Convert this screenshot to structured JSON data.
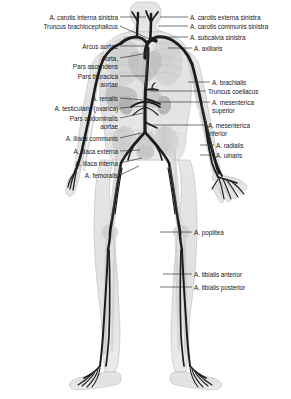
{
  "figure": {
    "type": "anatomical-diagram",
    "view": "anterior whole-body",
    "colors": {
      "artery": "#1c1c1c",
      "artery_highlight": "#6e6e6e",
      "body_silhouette": "#d9d9d9",
      "body_outline": "#9a9a9a",
      "organ": "#a8a8a8",
      "bone": "#c4c4c4",
      "leader_line": "#2b2b2b",
      "label_text": "#1a1a1a",
      "background": "#ffffff"
    }
  },
  "labels_left": [
    {
      "id": "carotis-interna-sinistra",
      "lines": [
        "A. carotis interna sinistra"
      ],
      "x_right": 118,
      "y": 14,
      "leader": {
        "x1": 120,
        "y1": 17,
        "x2": 146,
        "y2": 17
      }
    },
    {
      "id": "truncus-brachiocephalicus",
      "lines": [
        "Truncus brachiocephalicus"
      ],
      "x_right": 118,
      "y": 23,
      "leader": {
        "x1": 120,
        "y1": 26,
        "x2": 152,
        "y2": 40
      }
    },
    {
      "id": "arcus-aortae",
      "lines": [
        "Arcus aortae"
      ],
      "x_right": 118,
      "y": 43,
      "leader": {
        "x1": 120,
        "y1": 46,
        "x2": 146,
        "y2": 46
      }
    },
    {
      "id": "aorta-pars-ascendens",
      "lines": [
        "Aorta,",
        "Pars ascendens"
      ],
      "x_right": 118,
      "y": 55,
      "leader": {
        "x1": 120,
        "y1": 58,
        "x2": 148,
        "y2": 53
      }
    },
    {
      "id": "pars-thoracica-aortae",
      "lines": [
        "Pars thoracica",
        "aortae"
      ],
      "x_right": 118,
      "y": 73,
      "leader": {
        "x1": 120,
        "y1": 76,
        "x2": 146,
        "y2": 76
      }
    },
    {
      "id": "a-renalis",
      "lines": [
        "A. renalis"
      ],
      "x_right": 118,
      "y": 95,
      "leader": {
        "x1": 120,
        "y1": 98,
        "x2": 143,
        "y2": 100
      }
    },
    {
      "id": "a-testicularis-ovarica",
      "lines": [
        "A. testicularis (ovarica)"
      ],
      "x_right": 118,
      "y": 105,
      "leader": {
        "x1": 120,
        "y1": 108,
        "x2": 144,
        "y2": 106
      }
    },
    {
      "id": "pars-abdominalis-aortae",
      "lines": [
        "Pars abdominalis",
        "aortae"
      ],
      "x_right": 118,
      "y": 115,
      "leader": {
        "x1": 120,
        "y1": 118,
        "x2": 143,
        "y2": 113
      }
    },
    {
      "id": "a-iliaca-communis",
      "lines": [
        "A. iliaca communis"
      ],
      "x_right": 118,
      "y": 135,
      "leader": {
        "x1": 120,
        "y1": 138,
        "x2": 141,
        "y2": 133
      }
    },
    {
      "id": "a-iliaca-externa",
      "lines": [
        "A. iliaca externa"
      ],
      "x_right": 118,
      "y": 148,
      "leader": {
        "x1": 120,
        "y1": 151,
        "x2": 140,
        "y2": 150
      }
    },
    {
      "id": "a-iliaca-interna",
      "lines": [
        "A. iliaca interna"
      ],
      "x_right": 118,
      "y": 160,
      "leader": {
        "x1": 120,
        "y1": 163,
        "x2": 142,
        "y2": 158
      }
    },
    {
      "id": "a-femoralis",
      "lines": [
        "A. femoralis"
      ],
      "x_right": 118,
      "y": 172,
      "leader": {
        "x1": 120,
        "y1": 175,
        "x2": 139,
        "y2": 166
      }
    }
  ],
  "labels_right": [
    {
      "id": "carotis-externa-sinistra",
      "lines": [
        "A. carotis externa sinistra"
      ],
      "x_left": 190,
      "y": 14,
      "leader": {
        "x1": 160,
        "y1": 17,
        "x2": 188,
        "y2": 17
      }
    },
    {
      "id": "carotis-communis-sinistra",
      "lines": [
        "A. carotis communis sinistra"
      ],
      "x_left": 190,
      "y": 23,
      "leader": {
        "x1": 158,
        "y1": 26,
        "x2": 188,
        "y2": 26
      }
    },
    {
      "id": "a-subclavia-sinistra",
      "lines": [
        "A. subcalvia sinistra"
      ],
      "x_left": 190,
      "y": 34,
      "leader": {
        "x1": 160,
        "y1": 37,
        "x2": 188,
        "y2": 37
      }
    },
    {
      "id": "a-axillaris",
      "lines": [
        "A. axillaris"
      ],
      "x_left": 194,
      "y": 45,
      "leader": {
        "x1": 168,
        "y1": 48,
        "x2": 192,
        "y2": 48
      }
    },
    {
      "id": "a-brachialis",
      "lines": [
        "A. brachialis"
      ],
      "x_left": 212,
      "y": 79,
      "leader": {
        "x1": 188,
        "y1": 82,
        "x2": 210,
        "y2": 82
      }
    },
    {
      "id": "truncus-coeliacus",
      "lines": [
        "Truncus coeliacus"
      ],
      "x_left": 208,
      "y": 88,
      "leader": {
        "x1": 150,
        "y1": 91,
        "x2": 206,
        "y2": 91
      }
    },
    {
      "id": "a-mesenterica-superior",
      "lines": [
        "A. mesenterica",
        "superior"
      ],
      "x_left": 212,
      "y": 99,
      "leader": {
        "x1": 150,
        "y1": 102,
        "x2": 210,
        "y2": 102
      }
    },
    {
      "id": "a-mesenterica-inferior",
      "lines": [
        "A. mesenterica",
        "inferior"
      ],
      "x_left": 208,
      "y": 122,
      "leader": {
        "x1": 148,
        "y1": 125,
        "x2": 206,
        "y2": 125
      }
    },
    {
      "id": "a-radialis",
      "lines": [
        "A. radialis"
      ],
      "x_left": 216,
      "y": 142,
      "leader": {
        "x1": 200,
        "y1": 145,
        "x2": 214,
        "y2": 145
      }
    },
    {
      "id": "a-ulnaris",
      "lines": [
        "A. ulnaris"
      ],
      "x_left": 216,
      "y": 152,
      "leader": {
        "x1": 200,
        "y1": 155,
        "x2": 214,
        "y2": 155
      }
    },
    {
      "id": "a-poplitea",
      "lines": [
        "A. poplitea"
      ],
      "x_left": 194,
      "y": 229,
      "leader": {
        "x1": 160,
        "y1": 232,
        "x2": 192,
        "y2": 232
      }
    },
    {
      "id": "a-tibialis-anterior",
      "lines": [
        "A. tibialis anterior"
      ],
      "x_left": 194,
      "y": 271,
      "leader": {
        "x1": 163,
        "y1": 274,
        "x2": 192,
        "y2": 274
      }
    },
    {
      "id": "a-tibialis-posterior",
      "lines": [
        "A. tibialis posterior"
      ],
      "x_left": 194,
      "y": 284,
      "leader": {
        "x1": 160,
        "y1": 287,
        "x2": 192,
        "y2": 287
      }
    }
  ]
}
